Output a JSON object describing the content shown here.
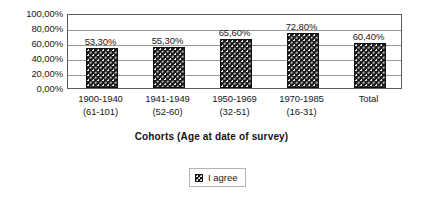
{
  "chart_data": {
    "type": "bar",
    "title": "",
    "subtitle": "",
    "xlabel": "Cohorts (Age at date of survey)",
    "ylabel": "",
    "categories": [
      "1900-1940 (61-101)",
      "1941-1949 (52-60)",
      "1950-1969 (32-51)",
      "1970-1985 (16-31)",
      "Total"
    ],
    "category_lines": [
      {
        "line1": "1900-1940",
        "line2": "(61-101)"
      },
      {
        "line1": "1941-1949",
        "line2": "(52-60)"
      },
      {
        "line1": "1950-1969",
        "line2": "(32-51)"
      },
      {
        "line1": "1970-1985",
        "line2": "(16-31)"
      },
      {
        "line1": "Total",
        "line2": ""
      }
    ],
    "values": [
      53.3,
      55.3,
      65.6,
      72.8,
      60.4
    ],
    "data_labels": [
      "53,30%",
      "55,30%",
      "65,60%",
      "72,80%",
      "60,40%"
    ],
    "series": [
      {
        "name": "I agree",
        "values": [
          53.3,
          55.3,
          65.6,
          72.8,
          60.4
        ]
      }
    ],
    "ylim": [
      0,
      100
    ],
    "ytick_values": [
      100,
      80,
      60,
      40,
      20,
      0
    ],
    "ytick_labels": [
      "100,00%",
      "80,00%",
      "60,00%",
      "40,00%",
      "20,00%",
      "0,00%"
    ],
    "grid": true,
    "grid_axis": "y",
    "legend": {
      "position": "bottom",
      "entries": [
        "I agree"
      ]
    },
    "colors": {
      "bar_fill": "#1b1b1b",
      "bar_pattern_dot": "#e8e8e8",
      "gridline": "#9a9a9a",
      "axis_frame": "#5c5c5c",
      "text": "#202020",
      "background": "#ffffff",
      "legend_border": "#b4b4b4"
    }
  },
  "legend": {
    "entry_label": "I agree"
  },
  "axis": {
    "x_title": "Cohorts (Age at date of survey)"
  }
}
